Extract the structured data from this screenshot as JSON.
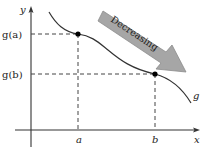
{
  "diagram": {
    "axes": {
      "x_label": "x",
      "y_label": "y"
    },
    "function_label": "g",
    "points": [
      {
        "x_label": "a",
        "y_label": "g(a)",
        "px": 78,
        "py": 34
      },
      {
        "x_label": "b",
        "y_label": "g(b)",
        "px": 155,
        "py": 74
      }
    ],
    "arrow": {
      "label": "Decreasing",
      "fill_color": "#a6a6a6",
      "stroke_color": "#8a8a8a"
    },
    "colors": {
      "curve": "#333333",
      "axis": "#333333",
      "dashed": "#444444",
      "point": "#000000"
    }
  }
}
